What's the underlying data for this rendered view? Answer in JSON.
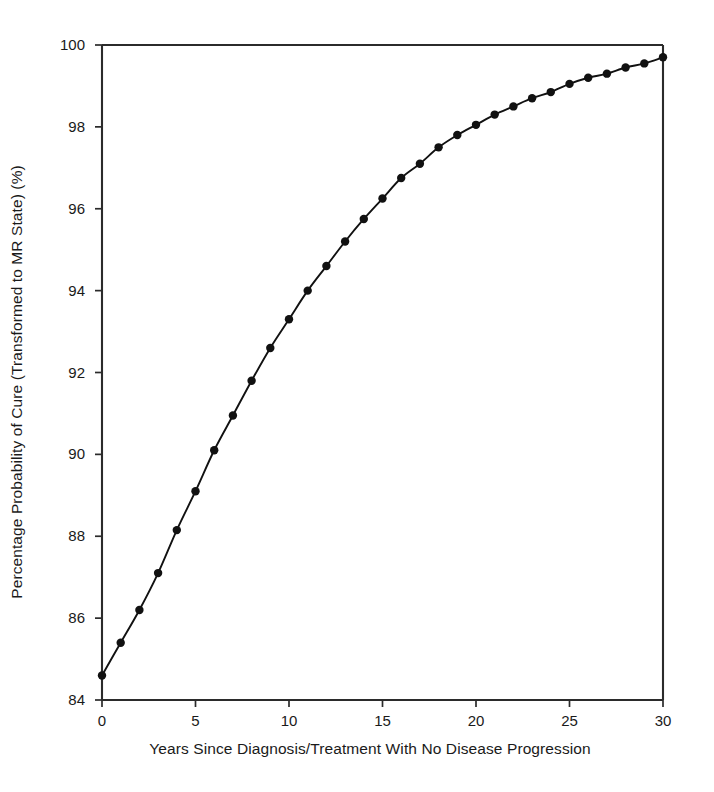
{
  "chart_data": {
    "type": "line",
    "title": "",
    "xlabel": "Years Since Diagnosis/Treatment With No Disease Progression",
    "ylabel": "Percentage Probability of Cure (Transformed to MR State) (%)",
    "xlim": [
      0,
      30
    ],
    "ylim": [
      84,
      100
    ],
    "xticks": [
      0,
      5,
      10,
      15,
      20,
      25,
      30
    ],
    "xtick_labels": [
      "0",
      "5",
      "10",
      "15",
      "20",
      "25",
      "30"
    ],
    "yticks": [
      84,
      86,
      88,
      90,
      92,
      94,
      96,
      98,
      100
    ],
    "ytick_labels": [
      "84",
      "86",
      "88",
      "90",
      "92",
      "94",
      "96",
      "98",
      "100"
    ],
    "grid": false,
    "legend": null,
    "marker": "filled-circle",
    "line_color": "#111111",
    "marker_color": "#111111",
    "x": [
      0,
      1,
      2,
      3,
      4,
      5,
      6,
      7,
      8,
      9,
      10,
      11,
      12,
      13,
      14,
      15,
      16,
      17,
      18,
      19,
      20,
      21,
      22,
      23,
      24,
      25,
      26,
      27,
      28,
      29,
      30
    ],
    "values": [
      84.6,
      85.4,
      86.2,
      87.1,
      88.15,
      89.1,
      90.1,
      90.95,
      91.8,
      92.6,
      93.3,
      94.0,
      94.6,
      95.2,
      95.75,
      96.25,
      96.75,
      97.1,
      97.5,
      97.8,
      98.05,
      98.3,
      98.5,
      98.7,
      98.85,
      99.05,
      99.2,
      99.3,
      99.45,
      99.55,
      99.7
    ],
    "series": [
      {
        "name": "Probability of cure",
        "values": [
          84.6,
          85.4,
          86.2,
          87.1,
          88.15,
          89.1,
          90.1,
          90.95,
          91.8,
          92.6,
          93.3,
          94.0,
          94.6,
          95.2,
          95.75,
          96.25,
          96.75,
          97.1,
          97.5,
          97.8,
          98.05,
          98.3,
          98.5,
          98.7,
          98.85,
          99.05,
          99.2,
          99.3,
          99.45,
          99.55,
          99.7
        ]
      }
    ]
  }
}
